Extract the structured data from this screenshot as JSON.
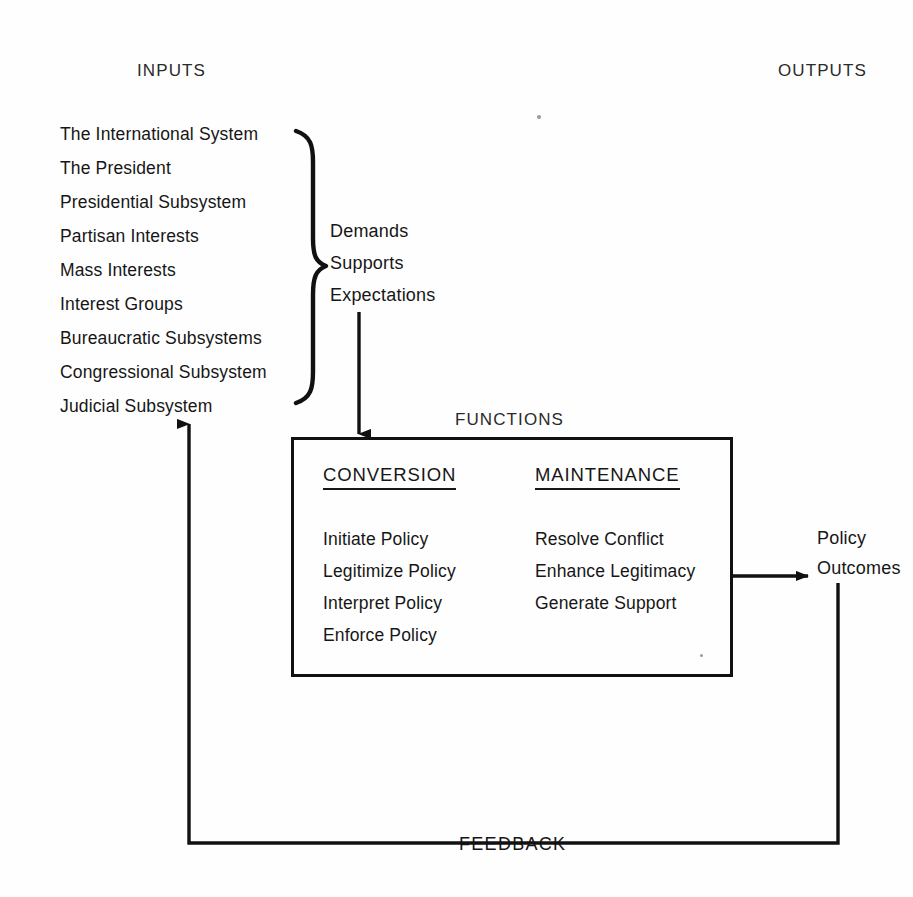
{
  "diagram": {
    "labels": {
      "inputs": "INPUTS",
      "outputs": "OUTPUTS",
      "functions": "FUNCTIONS",
      "feedback": "FEEDBACK"
    },
    "inputs": {
      "heading": "INPUTS",
      "items": [
        "The International System",
        "The President",
        "Presidential Subsystem",
        "Partisan Interests",
        "Mass Interests",
        "Interest Groups",
        "Bureaucratic Subsystems",
        "Congressional Subsystem",
        "Judicial Subsystem"
      ]
    },
    "flow": {
      "items": [
        "Demands",
        "Supports",
        "Expectations"
      ]
    },
    "functions_box": {
      "heading": "FUNCTIONS",
      "columns": [
        {
          "header": "CONVERSION",
          "items": [
            "Initiate Policy",
            "Legitimize Policy",
            "Interpret Policy",
            "Enforce Policy"
          ]
        },
        {
          "header": "MAINTENANCE",
          "items": [
            "Resolve Conflict",
            "Enhance Legitimacy",
            "Generate Support"
          ]
        }
      ]
    },
    "outputs": {
      "heading": "OUTPUTS",
      "result_lines": [
        "Policy",
        "Outcomes"
      ]
    },
    "colors": {
      "ink": "#161616",
      "line": "#111111",
      "background": "#fefefe"
    }
  }
}
